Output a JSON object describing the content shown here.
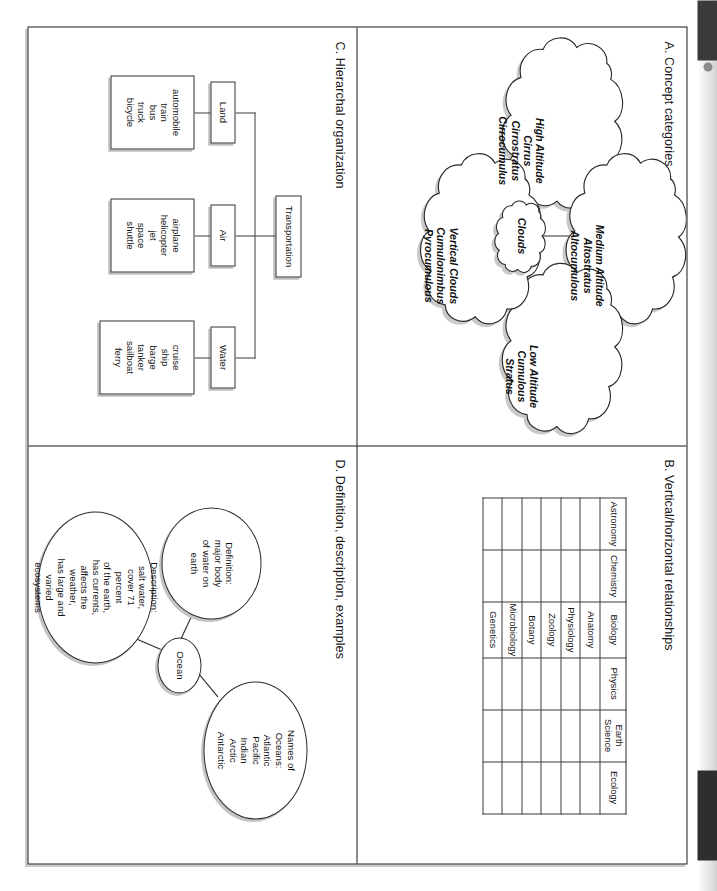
{
  "page": {
    "orientation": "rotated-90-cw",
    "quadrants": [
      "A",
      "B",
      "C",
      "D"
    ]
  },
  "quadrant_a": {
    "title": "A. Concept categories",
    "center": "Clouds",
    "branches": [
      {
        "name": "high-altitude",
        "text": "High Altitude\nCirrus\nCirrostratus\nCirrocumulus"
      },
      {
        "name": "medium-altitude",
        "text": "Medium Altitude\nAltostratus\nAltocumulous"
      },
      {
        "name": "low-altitude",
        "text": "Low Altitude\nCumulous\nStratus"
      },
      {
        "name": "vertical-clouds",
        "text": "Vertical Clouds\nCumulonimbus\nPyrocumulous"
      }
    ]
  },
  "quadrant_b": {
    "title": "B. Vertical/horizontal relationships",
    "columns": [
      "Astronomy",
      "Chemistry",
      "Biology",
      "Physics",
      "Earth\nScience",
      "Ecology"
    ],
    "rows": [
      [
        "",
        "",
        "Anatomy",
        "",
        "",
        ""
      ],
      [
        "",
        "",
        "Physiology",
        "",
        "",
        ""
      ],
      [
        "",
        "",
        "Zoology",
        "",
        "",
        ""
      ],
      [
        "",
        "",
        "Botany",
        "",
        "",
        ""
      ],
      [
        "",
        "",
        "Microbiology",
        "",
        "",
        ""
      ],
      [
        "",
        "",
        "Genetics",
        "",
        "",
        ""
      ]
    ]
  },
  "quadrant_c": {
    "title": "C. Hierarchal organization",
    "root": "Transportation",
    "categories": [
      {
        "label": "Land",
        "items": "automobile\ntrain\nbus\ntruck\nbicycle"
      },
      {
        "label": "Air",
        "items": "airplane\nhelicopter\njet\nspace\nshuttle"
      },
      {
        "label": "Water",
        "items": "cruise\nship\nbarge\ntanker\nsailboat\nferry"
      }
    ]
  },
  "quadrant_d": {
    "title": "D. Definition, description, examples",
    "center": "Ocean",
    "nodes": [
      {
        "name": "definition",
        "text": "Definition:\nmajor body\nof water on\nearth"
      },
      {
        "name": "names-of-oceans",
        "text": "Names of\nOceans:\nAtlantic\nPacific\nIndian\nArctic\nAntarctic"
      },
      {
        "name": "description",
        "text": "Description:\nsalt water,\ncover 71\npercent\nof the earth,\nhas currents,\naffects the\nweather,\nhas large and\nvaried\necosystems"
      }
    ]
  },
  "colors": {
    "ink": "#111111",
    "rule": "#1b1b1b",
    "shadow": "#c4c4c4",
    "paper": "#ffffff"
  }
}
